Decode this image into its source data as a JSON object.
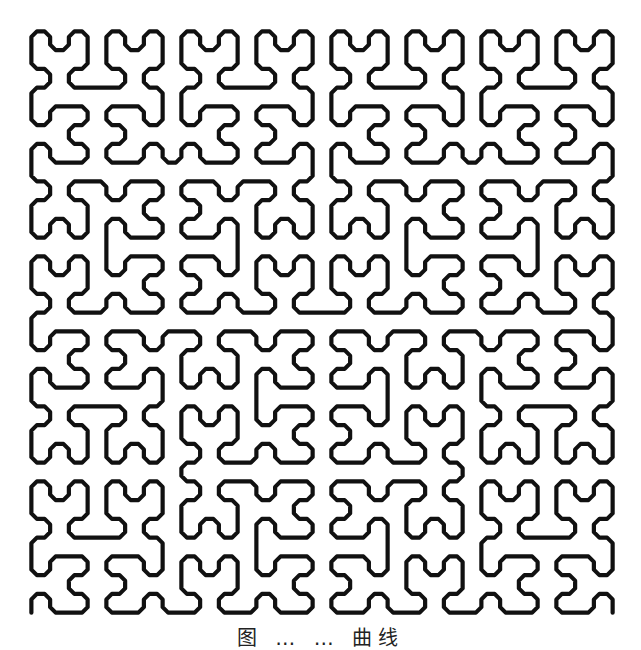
{
  "figure": {
    "kind": "space-filling curve",
    "order": 5,
    "grid_size": 32,
    "origin_x": 22,
    "origin_y": 22,
    "extent": 600,
    "stroke_color": "#111111",
    "stroke_width": 4.2,
    "chamfer": 5.5,
    "background": "#ffffff"
  },
  "caption": {
    "text": "图 … … 曲线",
    "visible": "partially (cut off at bottom edge)"
  }
}
